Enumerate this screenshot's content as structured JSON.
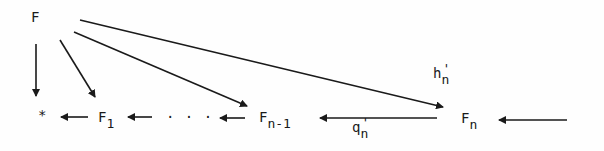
{
  "diagram": {
    "type": "commutative-diagram",
    "nodes": {
      "top": {
        "label": "F"
      },
      "star": {
        "label": "*"
      },
      "f1": {
        "base": "F",
        "sub": "1"
      },
      "dots": {
        "label": "· · ·"
      },
      "fn1": {
        "base": "F",
        "sub": "n-1"
      },
      "fn": {
        "base": "F",
        "sub": "n"
      }
    },
    "edge_labels": {
      "hn": {
        "base": "h",
        "sub": "n",
        "sup": "'"
      },
      "qn": {
        "base": "q",
        "sub": "n",
        "sup": "'"
      }
    },
    "edges": [
      {
        "from": "F",
        "to": "*"
      },
      {
        "from": "F",
        "to": "F_1"
      },
      {
        "from": "F",
        "to": "F_n-1"
      },
      {
        "from": "F",
        "to": "F_n",
        "label": "h'_n"
      },
      {
        "from": "F_1",
        "to": "*"
      },
      {
        "from": "...",
        "to": "F_1"
      },
      {
        "from": "F_n-1",
        "to": "..."
      },
      {
        "from": "F_n",
        "to": "F_n-1",
        "label": "q'_n"
      },
      {
        "from": "(incoming)",
        "to": "F_n"
      }
    ],
    "colors": {
      "ink": "#1a1a1a",
      "background": "#fefefe"
    }
  }
}
